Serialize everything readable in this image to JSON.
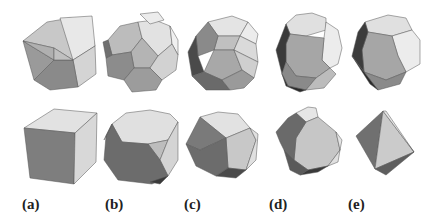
{
  "figure": {
    "labels": [
      "(a)",
      "(b)",
      "(c)",
      "(d)",
      "(e)"
    ],
    "top_row": [
      {
        "label": "(a)",
        "shape": "icosahedron"
      },
      {
        "label": "(b)",
        "shape": "truncated-icosahedron"
      },
      {
        "label": "(c)",
        "shape": "icosidodecahedron"
      },
      {
        "label": "(d)",
        "shape": "truncated-dodecahedron"
      },
      {
        "label": "(e)",
        "shape": "dodecahedron"
      }
    ],
    "bottom_row": [
      {
        "label": "(a)",
        "shape": "cube"
      },
      {
        "label": "(b)",
        "shape": "truncated-cube"
      },
      {
        "label": "(c)",
        "shape": "cuboctahedron"
      },
      {
        "label": "(d)",
        "shape": "truncated-octahedron"
      },
      {
        "label": "(e)",
        "shape": "octahedron"
      }
    ],
    "colors": {
      "light": "#e6e6e6",
      "mid": "#c4c4c4",
      "midDark": "#a8a8a8",
      "dark": "#7a7a7a",
      "darkest": "#3c3c3c",
      "edge": "#555555"
    }
  }
}
